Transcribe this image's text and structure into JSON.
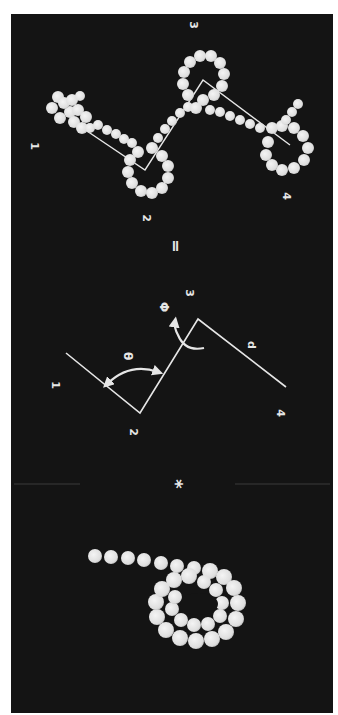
{
  "figure": {
    "background": "#141414",
    "foreground": "#e6e6e6",
    "orientation": "rotated 90° clockwise",
    "equation": {
      "operator_star": "*",
      "operator_equals": "="
    },
    "bond_diagram": {
      "points": [
        "1",
        "2",
        "3",
        "4"
      ],
      "angle_label": "θ",
      "dihedral_label": "Φ",
      "distance_label": "d"
    },
    "bead_model": {
      "points": [
        "1",
        "2",
        "3",
        "4"
      ]
    }
  }
}
